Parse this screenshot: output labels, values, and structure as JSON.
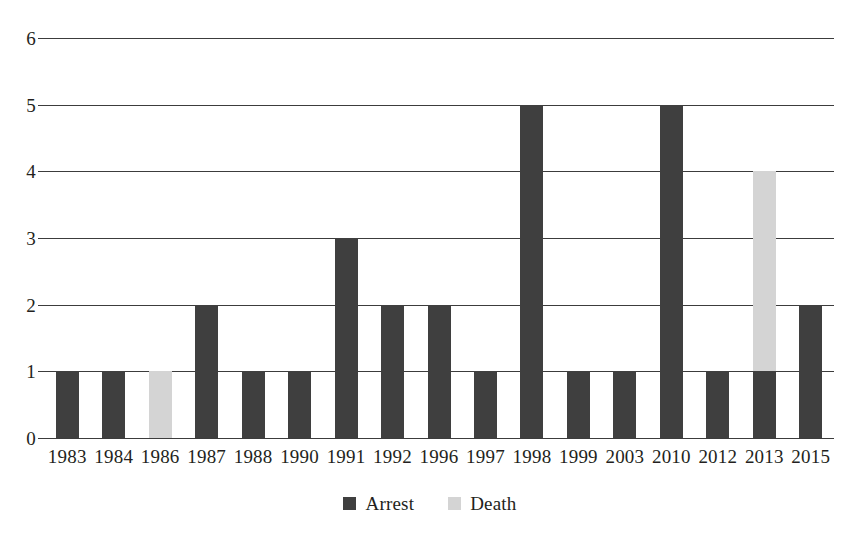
{
  "chart_data": {
    "type": "bar",
    "stacked": true,
    "title": "",
    "xlabel": "",
    "ylabel": "",
    "ylim": [
      0,
      6
    ],
    "yticks": [
      "0",
      "1",
      "2",
      "3",
      "4",
      "5",
      "6"
    ],
    "grid": true,
    "legend_position": "bottom-center",
    "categories": [
      "1983",
      "1984",
      "1986",
      "1987",
      "1988",
      "1990",
      "1991",
      "1992",
      "1996",
      "1997",
      "1998",
      "1999",
      "2003",
      "2010",
      "2012",
      "2013",
      "2015"
    ],
    "series": [
      {
        "name": "Arrest",
        "color": "#3f3f3f",
        "values": [
          1,
          1,
          0,
          2,
          1,
          1,
          3,
          2,
          2,
          1,
          5,
          1,
          1,
          5,
          1,
          1,
          2
        ]
      },
      {
        "name": "Death",
        "color": "#d4d4d4",
        "values": [
          0,
          0,
          1,
          0,
          0,
          0,
          0,
          0,
          0,
          0,
          0,
          0,
          0,
          0,
          0,
          3,
          0
        ]
      }
    ],
    "totals": [
      1,
      1,
      1,
      2,
      1,
      1,
      3,
      2,
      2,
      1,
      5,
      1,
      1,
      5,
      1,
      4,
      2
    ]
  },
  "legend": {
    "items": [
      {
        "label": "Arrest",
        "color": "#3f3f3f",
        "swatch_name": "legend-swatch-arrest"
      },
      {
        "label": "Death",
        "color": "#d4d4d4",
        "swatch_name": "legend-swatch-death"
      }
    ]
  },
  "title_remnant": ""
}
